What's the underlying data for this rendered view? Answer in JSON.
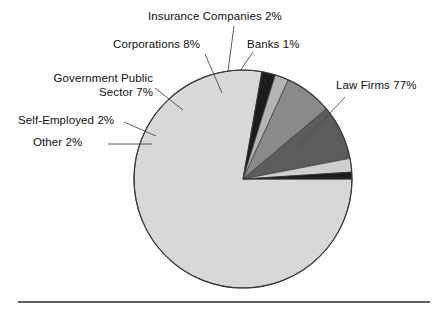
{
  "chart_data": {
    "type": "pie",
    "title": "",
    "subtitle": "",
    "xlabel": "",
    "ylabel": "",
    "legend_position": "callout-labels",
    "grid": false,
    "start_angle_deg": 0,
    "direction": "clockwise",
    "categories": [
      "Law Firms",
      "Other",
      "Self-Employed",
      "Government Public Sector",
      "Corporations",
      "Insurance Companies",
      "Banks"
    ],
    "values": [
      77,
      2,
      2,
      7,
      8,
      2,
      1
    ],
    "value_unit": "%",
    "slices": [
      {
        "name": "Law Firms",
        "value": 77,
        "label": "Law Firms 77%",
        "color": "#d8d8d8",
        "start_deg": 0,
        "end_deg": 277.2
      },
      {
        "name": "Other",
        "value": 2,
        "label": "Other 2%",
        "color": "#1c1c1c",
        "start_deg": 277.2,
        "end_deg": 284.4
      },
      {
        "name": "Self-Employed",
        "value": 2,
        "label": "Self-Employed 2%",
        "color": "#b4b4b4",
        "start_deg": 284.4,
        "end_deg": 291.6
      },
      {
        "name": "Government Public Sector",
        "value": 7,
        "label": "Government Public Sector 7%",
        "color": "#8a8a8a",
        "start_deg": 291.6,
        "end_deg": 316.8
      },
      {
        "name": "Corporations",
        "value": 8,
        "label": "Corporations 8%",
        "color": "#5c5c5c",
        "start_deg": 316.8,
        "end_deg": 345.6
      },
      {
        "name": "Insurance Companies",
        "value": 2,
        "label": "Insurance Companies 2%",
        "color": "#cfcfcf",
        "start_deg": 345.6,
        "end_deg": 352.8
      },
      {
        "name": "Banks",
        "value": 1,
        "label": "Banks 1%",
        "color": "#1c1c1c",
        "start_deg": 352.8,
        "end_deg": 356.4
      }
    ]
  },
  "labels": {
    "insurance": "Insurance Companies 2%",
    "corporations": "Corporations 8%",
    "banks": "Banks 1%",
    "government_line1": "Government Public",
    "government_line2": "Sector 7%",
    "self_employed": "Self-Employed 2%",
    "other": "Other 2%",
    "law_firms": "Law Firms 77%"
  },
  "colors": {
    "background": "#ffffff",
    "text": "#101010",
    "outline": "#3a3a3a",
    "leader_line": "#4a4a4a",
    "rule": "#2a2a2a"
  }
}
